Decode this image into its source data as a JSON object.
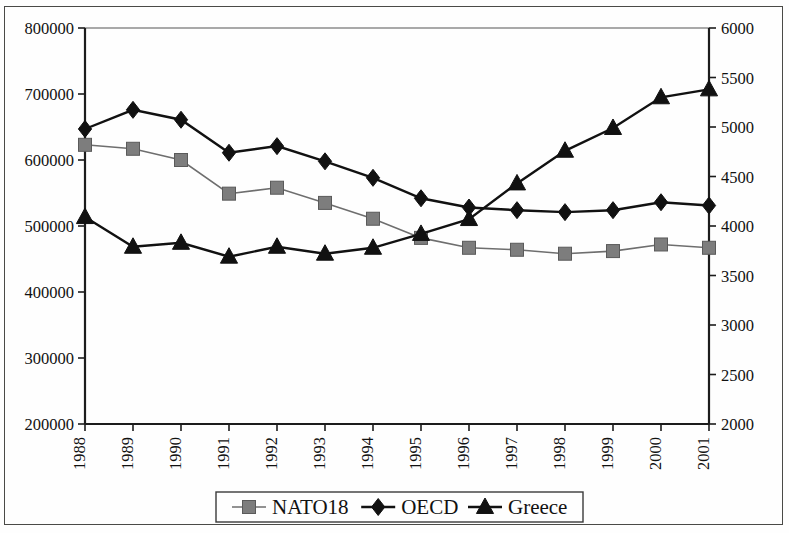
{
  "chart_data": {
    "type": "line",
    "title": "",
    "subtitle": "",
    "xlabel": "",
    "ylabel": "",
    "y2label": "",
    "grid": false,
    "legend_position": "bottom",
    "categories": [
      "1988",
      "1989",
      "1990",
      "1991",
      "1992",
      "1993",
      "1994",
      "1995",
      "1996",
      "1997",
      "1998",
      "1999",
      "2000",
      "2001"
    ],
    "x": [
      1988,
      1989,
      1990,
      1991,
      1992,
      1993,
      1994,
      1995,
      1996,
      1997,
      1998,
      1999,
      2000,
      2001
    ],
    "ylim": [
      200000,
      800000
    ],
    "yticks": [
      "200000",
      "300000",
      "400000",
      "500000",
      "600000",
      "700000",
      "800000"
    ],
    "y2lim": [
      2000,
      6000
    ],
    "y2ticks": [
      "2000",
      "2500",
      "3000",
      "3500",
      "4000",
      "4500",
      "5000",
      "5500",
      "6000"
    ],
    "series": [
      {
        "name": "NATO18",
        "axis": "left",
        "marker": "square",
        "color": "#7d7d7d",
        "line_color": "#6e6e6e",
        "values": [
          623000,
          617000,
          600000,
          549000,
          558000,
          535000,
          511000,
          482000,
          467000,
          464000,
          458000,
          462000,
          472000,
          467000
        ]
      },
      {
        "name": "OECD",
        "axis": "left",
        "marker": "diamond",
        "color": "#111111",
        "line_color": "#111111",
        "values": [
          647000,
          676000,
          661000,
          611000,
          621000,
          598000,
          573000,
          542000,
          528000,
          524000,
          521000,
          524000,
          536000,
          531000
        ]
      },
      {
        "name": "Greece",
        "axis": "right",
        "marker": "triangle",
        "color": "#111111",
        "line_color": "#111111",
        "values": [
          4090,
          3790,
          3830,
          3690,
          3790,
          3720,
          3780,
          3920,
          4070,
          4430,
          4760,
          4990,
          5300,
          5380
        ]
      }
    ]
  },
  "legend": {
    "items": [
      {
        "label": "NATO18",
        "marker": "square"
      },
      {
        "label": "OECD",
        "marker": "diamond"
      },
      {
        "label": "Greece",
        "marker": "triangle"
      }
    ]
  },
  "colors": {
    "axis": "#1c1c1c",
    "frame": "#4a4a47",
    "nato18": "#7d7d7d",
    "oecd": "#111111",
    "greece": "#111111",
    "background": "#fefefe"
  }
}
